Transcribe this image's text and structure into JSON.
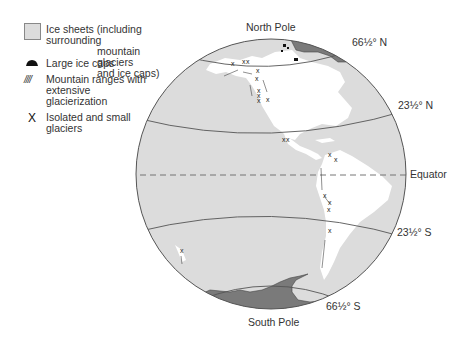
{
  "legend": {
    "items": [
      {
        "symbol": "light-gray-square",
        "lines": [
          "Ice sheets (including surrounding",
          "mountain glaciers",
          "and ice caps)"
        ]
      },
      {
        "symbol": "black-dome",
        "lines": [
          "Large ice caps"
        ]
      },
      {
        "symbol": "hatch-lines",
        "glyph": "////",
        "lines": [
          "Mountain ranges with",
          "extensive",
          "glacierization"
        ]
      },
      {
        "symbol": "x-mark",
        "glyph": "X",
        "lines": [
          "Isolated and small",
          "glaciers"
        ]
      }
    ]
  },
  "map": {
    "labels": {
      "north_pole": "North Pole",
      "south_pole": "South Pole",
      "arctic_circle": "66½° N",
      "tropic_cancer": "23½° N",
      "equator": "Equator",
      "tropic_capricorn": "23½° S",
      "antarctic_circle": "66½° S"
    },
    "colors": {
      "ocean": "#dcdcdc",
      "land": "#ffffff",
      "ice_sheet": "#7a7a7a",
      "outline": "#555555"
    }
  }
}
